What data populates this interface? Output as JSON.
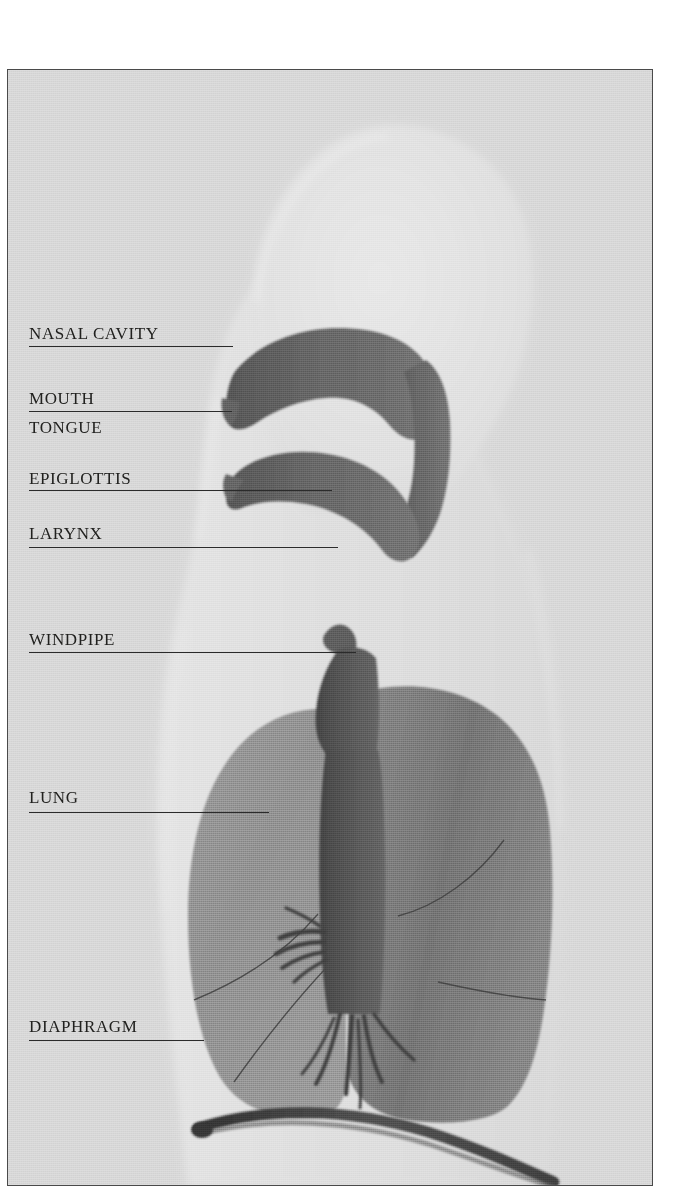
{
  "figure": {
    "plate_background": "#d4d4d4",
    "page_background": "#ffffff",
    "border_color": "#4a4a4a",
    "ink_color": "#2b2b2b",
    "airway_color": "#5c5c5c",
    "lung_color": "#6e6e6e",
    "body_silhouette_color": "#dcdcdc"
  },
  "labels": [
    {
      "id": "nasal-cavity",
      "text": "NASAL CAVITY"
    },
    {
      "id": "mouth",
      "text": "MOUTH"
    },
    {
      "id": "tongue",
      "text": "TONGUE"
    },
    {
      "id": "epiglottis",
      "text": "EPIGLOTTIS"
    },
    {
      "id": "larynx",
      "text": "LARYNX"
    },
    {
      "id": "windpipe",
      "text": "WINDPIPE"
    },
    {
      "id": "lung",
      "text": "LUNG"
    },
    {
      "id": "diaphragm",
      "text": "DIAPHRAGM"
    }
  ],
  "anatomy_parts": [
    "head-silhouette",
    "torso-silhouette",
    "nasal-cavity-passage",
    "tongue",
    "oral-cavity",
    "epiglottis",
    "larynx",
    "trachea",
    "bronchi",
    "left-lung",
    "right-lung",
    "diaphragm"
  ]
}
